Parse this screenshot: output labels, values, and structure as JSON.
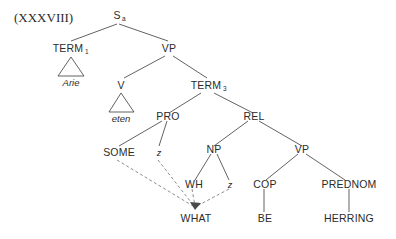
{
  "figure": {
    "example_number": "(XXXVIII)",
    "caption": ""
  },
  "tree": {
    "nodes": {
      "root": {
        "label": "S",
        "subscript": "a"
      },
      "term1": {
        "label": "TERM",
        "subscript": "1"
      },
      "vp_top": {
        "label": "VP",
        "subscript": ""
      },
      "v": {
        "label": "V",
        "subscript": ""
      },
      "term3": {
        "label": "TERM",
        "subscript": "3"
      },
      "pro": {
        "label": "PRO",
        "subscript": ""
      },
      "rel": {
        "label": "REL",
        "subscript": ""
      },
      "some": {
        "label": "SOME",
        "subscript": ""
      },
      "z_pro": {
        "label": "z",
        "subscript": ""
      },
      "np": {
        "label": "NP",
        "subscript": ""
      },
      "vp_rel": {
        "label": "VP",
        "subscript": ""
      },
      "wh": {
        "label": "WH",
        "subscript": ""
      },
      "z_np": {
        "label": "z",
        "subscript": ""
      },
      "cop": {
        "label": "COP",
        "subscript": ""
      },
      "prednom": {
        "label": "PREDNOM",
        "subscript": ""
      },
      "what": {
        "label": "WHAT",
        "subscript": ""
      },
      "be": {
        "label": "BE",
        "subscript": ""
      },
      "herring": {
        "label": "HERRING",
        "subscript": ""
      }
    },
    "terminals": {
      "arie": "Arie",
      "eten": "eten"
    }
  }
}
